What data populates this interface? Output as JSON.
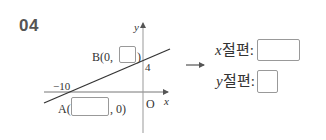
{
  "problem": {
    "number": "04"
  },
  "graph": {
    "axis_x_label": "x",
    "axis_y_label": "y",
    "origin_label": "O",
    "y_intercept_tick": "4",
    "x_intercept_tick": "−10",
    "point_b": {
      "prefix": "B(0,",
      "suffix": ")",
      "blank_value": ""
    },
    "point_a": {
      "prefix": "A(",
      "suffix": ", 0)",
      "blank_value": ""
    }
  },
  "arrow": "⟶",
  "answers": {
    "x_intercept": {
      "var": "x",
      "label": "절편:",
      "value": ""
    },
    "y_intercept": {
      "var": "y",
      "label": "절편:",
      "value": ""
    }
  },
  "colors": {
    "number": "#555555",
    "line": "#333333",
    "axis": "#777777",
    "box_border": "#999999"
  }
}
